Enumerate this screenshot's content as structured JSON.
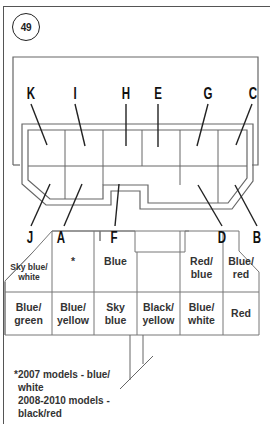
{
  "badge": {
    "number": "49"
  },
  "pins_top": [
    {
      "label": "K",
      "x": 40
    },
    {
      "label": "I",
      "x": 76
    },
    {
      "label": "H",
      "x": 125
    },
    {
      "label": "E",
      "x": 158
    },
    {
      "label": "G",
      "x": 206
    },
    {
      "label": "C",
      "x": 251
    }
  ],
  "pins_bottom": [
    {
      "label": "J",
      "x": 30
    },
    {
      "label": "A",
      "x": 62
    },
    {
      "label": "F",
      "x": 114
    },
    {
      "label": "D",
      "x": 222
    },
    {
      "label": "B",
      "x": 257
    }
  ],
  "wire_table": {
    "row1": [
      {
        "text": "Sky blue/ white",
        "small": true
      },
      {
        "text": "*"
      },
      {
        "text": "Blue"
      },
      {
        "text": ""
      },
      {
        "text": "Red/ blue"
      },
      {
        "text": "Blue/ red"
      }
    ],
    "row2": [
      {
        "text": "Blue/ green"
      },
      {
        "text": "Blue/ yellow"
      },
      {
        "text": "Sky blue"
      },
      {
        "text": "Black/ yellow"
      },
      {
        "text": "Blue/ white"
      },
      {
        "text": "Red"
      }
    ]
  },
  "footnote": {
    "line1": "*2007 models - blue/",
    "line2": "white",
    "line3": "2008-2010 models -",
    "line4": "black/red"
  },
  "colors": {
    "line": "#555555",
    "text": "#222222"
  }
}
